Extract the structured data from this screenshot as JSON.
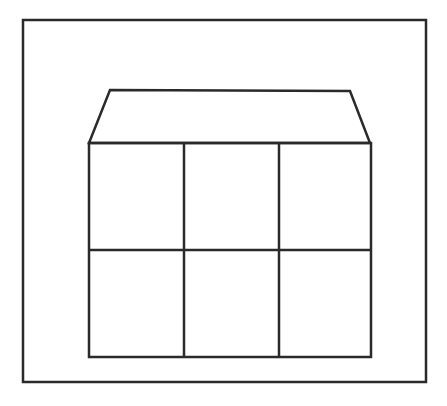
{
  "diagram": {
    "stroke_color": "#2a2a2a",
    "background": "#ffffff",
    "outer_frame": {
      "x": 23,
      "y": 20,
      "width": 403,
      "height": 362
    },
    "roof": {
      "points": "110,90 350,91 370,143 89,143"
    },
    "grid": {
      "x": 89,
      "y": 143,
      "width": 282,
      "height": 214,
      "columns": 3,
      "rows": 2,
      "vertical_dividers": [
        184,
        279
      ],
      "horizontal_dividers": [
        250
      ]
    }
  }
}
